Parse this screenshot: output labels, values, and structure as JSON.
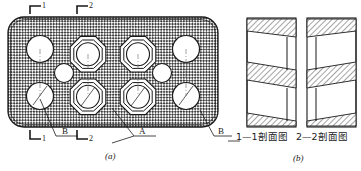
{
  "figure": {
    "kind": "engineering-drawing",
    "sub_figures": [
      {
        "id": "a",
        "caption": "(a)",
        "description": "plan-view-of-hatched-plate-with-holes"
      },
      {
        "id": "b",
        "caption": "(b)",
        "description": "two-section-views"
      }
    ]
  },
  "plan_view": {
    "section_marks_top": [
      {
        "label": "1",
        "corner": "top-left-bracket"
      },
      {
        "label": "2",
        "corner": "top-left-bracket"
      }
    ],
    "section_marks_bottom": [
      {
        "label": "1",
        "corner": "bottom-left-bracket"
      },
      {
        "label": "2",
        "corner": "bottom-left-bracket"
      }
    ],
    "leader_labels": [
      {
        "label": "B",
        "target": "plain-round-hole-lower-left"
      },
      {
        "label": "A",
        "target": "octagonal-boss-hole"
      },
      {
        "label": "B",
        "target": "plain-round-hole-lower-right"
      }
    ],
    "fill": "cross-hatch-mesh",
    "hole_groups": [
      {
        "name": "plain-holes-left-column",
        "count": 2,
        "shape": "circle"
      },
      {
        "name": "octagonal-holes-inner",
        "count": 4,
        "shape": "octagon-with-circle"
      },
      {
        "name": "plain-holes-right-column",
        "count": 2,
        "shape": "circle"
      },
      {
        "name": "small-center-holes",
        "count": 2,
        "shape": "circle"
      }
    ]
  },
  "section_views": [
    {
      "id": "s1",
      "caption": "1—1剖面图",
      "hatch": "diagonal-45-right",
      "taper": "left-to-right"
    },
    {
      "id": "s2",
      "caption": "2—2剖面图",
      "hatch": "diagonal-45-right",
      "taper": "right-to-left"
    }
  ],
  "colors": {
    "line": "#1a1a1a",
    "hatch": "#555555",
    "background": "#ffffff",
    "mesh_dark": "#4a4a4a",
    "mesh_light": "#e8e8e8"
  }
}
